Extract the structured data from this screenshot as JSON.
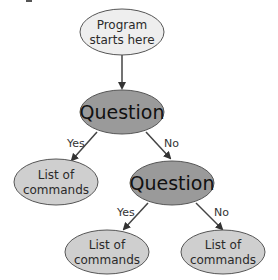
{
  "diagram": {
    "colors": {
      "start_fill": "#eeeeee",
      "question_fill": "#9a9a9a",
      "list_fill": "#cfcfcf",
      "stroke": "#555555",
      "arrow": "#444444"
    },
    "nodes": {
      "start": {
        "line1": "Program",
        "line2": "starts here"
      },
      "question1": {
        "label": "Question"
      },
      "list_left": {
        "line1": "List of",
        "line2": "commands"
      },
      "question2": {
        "label": "Question"
      },
      "list_bottom_left": {
        "line1": "List of",
        "line2": "commands"
      },
      "list_bottom_right": {
        "line1": "List of",
        "line2": "commands"
      }
    },
    "edges": {
      "q1_yes": "Yes",
      "q1_no": "No",
      "q2_yes": "Yes",
      "q2_no": "No"
    }
  }
}
